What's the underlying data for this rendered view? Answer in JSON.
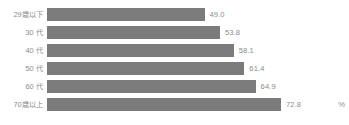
{
  "chart_data": {
    "type": "bar",
    "orientation": "horizontal",
    "title": "",
    "xlabel": "",
    "ylabel": "",
    "unit": "%",
    "grid": false,
    "legend": false,
    "xlim": [
      0,
      72.8
    ],
    "categories": [
      "29歳以下",
      "30 代",
      "40 代",
      "50 代",
      "60 代",
      "70歳以上"
    ],
    "values": [
      49.0,
      53.8,
      58.1,
      61.4,
      64.9,
      72.8
    ],
    "value_labels": [
      "49.0",
      "53.8",
      "58.1",
      "61.4",
      "64.9",
      "72.8"
    ],
    "series": [
      {
        "name": "",
        "color": "#7b7b7b",
        "values": [
          49.0,
          53.8,
          58.1,
          61.4,
          64.9,
          72.8
        ]
      }
    ]
  },
  "style": {
    "bar_color": "#7b7b7b",
    "label_color": "#8c8c8c",
    "background": "#ffffff"
  }
}
